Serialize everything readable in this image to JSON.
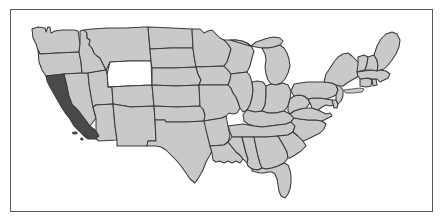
{
  "figure": {
    "type": "choropleth-map",
    "region": "United States (contiguous 48 states)",
    "title": "",
    "caption": "",
    "background_color": "#ffffff"
  },
  "frame": {
    "visible": true,
    "stroke_color": "#5a5a5c",
    "stroke_width": 1.6,
    "x": 10,
    "y": 9,
    "width": 423,
    "height": 203
  },
  "legend": {
    "visible": false,
    "entries": []
  },
  "colors": {
    "default_state_fill": "#c9c9c9",
    "highlight_fill": "#4a4a4a",
    "unshaded_fill": "#ffffff",
    "border_stroke": "#3a3a3c",
    "lake_fill": "#ffffff"
  },
  "map_data": {
    "highlighted_states": [
      "California"
    ],
    "unshaded_states": [
      "Wyoming"
    ],
    "shaded_states": [
      "Washington",
      "Oregon",
      "Idaho",
      "Montana",
      "Nevada",
      "Utah",
      "Arizona",
      "Colorado",
      "New Mexico",
      "North Dakota",
      "South Dakota",
      "Nebraska",
      "Kansas",
      "Oklahoma",
      "Texas",
      "Minnesota",
      "Iowa",
      "Missouri",
      "Arkansas",
      "Louisiana",
      "Wisconsin",
      "Illinois",
      "Michigan",
      "Indiana",
      "Ohio",
      "Kentucky",
      "Tennessee",
      "Mississippi",
      "Alabama",
      "Georgia",
      "Florida",
      "South Carolina",
      "North Carolina",
      "Virginia",
      "West Virginia",
      "Maryland",
      "Delaware",
      "Pennsylvania",
      "New Jersey",
      "New York",
      "Connecticut",
      "Rhode Island",
      "Massachusetts",
      "Vermont",
      "New Hampshire",
      "Maine"
    ],
    "labels_visible": false,
    "state_count": 48
  },
  "states": [
    {
      "id": "WA",
      "name": "Washington",
      "fill": "#c9c9c9"
    },
    {
      "id": "OR",
      "name": "Oregon",
      "fill": "#c9c9c9"
    },
    {
      "id": "CA",
      "name": "California",
      "fill": "#4a4a4a"
    },
    {
      "id": "NV",
      "name": "Nevada",
      "fill": "#c9c9c9"
    },
    {
      "id": "ID",
      "name": "Idaho",
      "fill": "#c9c9c9"
    },
    {
      "id": "MT",
      "name": "Montana",
      "fill": "#c9c9c9"
    },
    {
      "id": "WY",
      "name": "Wyoming",
      "fill": "#ffffff"
    },
    {
      "id": "UT",
      "name": "Utah",
      "fill": "#c9c9c9"
    },
    {
      "id": "AZ",
      "name": "Arizona",
      "fill": "#c9c9c9"
    },
    {
      "id": "CO",
      "name": "Colorado",
      "fill": "#c9c9c9"
    },
    {
      "id": "NM",
      "name": "New Mexico",
      "fill": "#c9c9c9"
    },
    {
      "id": "ND",
      "name": "North Dakota",
      "fill": "#c9c9c9"
    },
    {
      "id": "SD",
      "name": "South Dakota",
      "fill": "#c9c9c9"
    },
    {
      "id": "NE",
      "name": "Nebraska",
      "fill": "#c9c9c9"
    },
    {
      "id": "KS",
      "name": "Kansas",
      "fill": "#c9c9c9"
    },
    {
      "id": "OK",
      "name": "Oklahoma",
      "fill": "#c9c9c9"
    },
    {
      "id": "TX",
      "name": "Texas",
      "fill": "#c9c9c9"
    },
    {
      "id": "MN",
      "name": "Minnesota",
      "fill": "#c9c9c9"
    },
    {
      "id": "IA",
      "name": "Iowa",
      "fill": "#c9c9c9"
    },
    {
      "id": "MO",
      "name": "Missouri",
      "fill": "#c9c9c9"
    },
    {
      "id": "AR",
      "name": "Arkansas",
      "fill": "#c9c9c9"
    },
    {
      "id": "LA",
      "name": "Louisiana",
      "fill": "#c9c9c9"
    },
    {
      "id": "WI",
      "name": "Wisconsin",
      "fill": "#c9c9c9"
    },
    {
      "id": "IL",
      "name": "Illinois",
      "fill": "#c9c9c9"
    },
    {
      "id": "MI",
      "name": "Michigan",
      "fill": "#c9c9c9"
    },
    {
      "id": "IN",
      "name": "Indiana",
      "fill": "#c9c9c9"
    },
    {
      "id": "OH",
      "name": "Ohio",
      "fill": "#c9c9c9"
    },
    {
      "id": "KY",
      "name": "Kentucky",
      "fill": "#c9c9c9"
    },
    {
      "id": "TN",
      "name": "Tennessee",
      "fill": "#c9c9c9"
    },
    {
      "id": "MS",
      "name": "Mississippi",
      "fill": "#c9c9c9"
    },
    {
      "id": "AL",
      "name": "Alabama",
      "fill": "#c9c9c9"
    },
    {
      "id": "GA",
      "name": "Georgia",
      "fill": "#c9c9c9"
    },
    {
      "id": "FL",
      "name": "Florida",
      "fill": "#c9c9c9"
    },
    {
      "id": "SC",
      "name": "South Carolina",
      "fill": "#c9c9c9"
    },
    {
      "id": "NC",
      "name": "North Carolina",
      "fill": "#c9c9c9"
    },
    {
      "id": "VA",
      "name": "Virginia",
      "fill": "#c9c9c9"
    },
    {
      "id": "WV",
      "name": "West Virginia",
      "fill": "#c9c9c9"
    },
    {
      "id": "MD",
      "name": "Maryland",
      "fill": "#c9c9c9"
    },
    {
      "id": "DE",
      "name": "Delaware",
      "fill": "#c9c9c9"
    },
    {
      "id": "PA",
      "name": "Pennsylvania",
      "fill": "#c9c9c9"
    },
    {
      "id": "NJ",
      "name": "New Jersey",
      "fill": "#c9c9c9"
    },
    {
      "id": "NY",
      "name": "New York",
      "fill": "#c9c9c9"
    },
    {
      "id": "CT",
      "name": "Connecticut",
      "fill": "#c9c9c9"
    },
    {
      "id": "RI",
      "name": "Rhode Island",
      "fill": "#c9c9c9"
    },
    {
      "id": "MA",
      "name": "Massachusetts",
      "fill": "#c9c9c9"
    },
    {
      "id": "VT",
      "name": "Vermont",
      "fill": "#c9c9c9"
    },
    {
      "id": "NH",
      "name": "New Hampshire",
      "fill": "#c9c9c9"
    },
    {
      "id": "ME",
      "name": "Maine",
      "fill": "#c9c9c9"
    }
  ]
}
